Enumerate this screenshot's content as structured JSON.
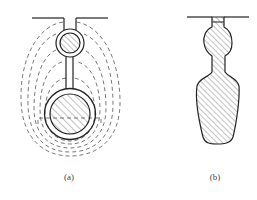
{
  "figure": {
    "panels": [
      {
        "id": "a",
        "label": "(a)",
        "description": "Slot with conductor cross-sections and dashed leakage flux lines"
      },
      {
        "id": "b",
        "label": "(b)",
        "description": "Hatched solid bar profile in slot (bulb and tapered body)"
      }
    ]
  },
  "colors": {
    "stroke": "#222222",
    "dashed": "#555555",
    "hatch": "#666666",
    "background": "#ffffff"
  }
}
